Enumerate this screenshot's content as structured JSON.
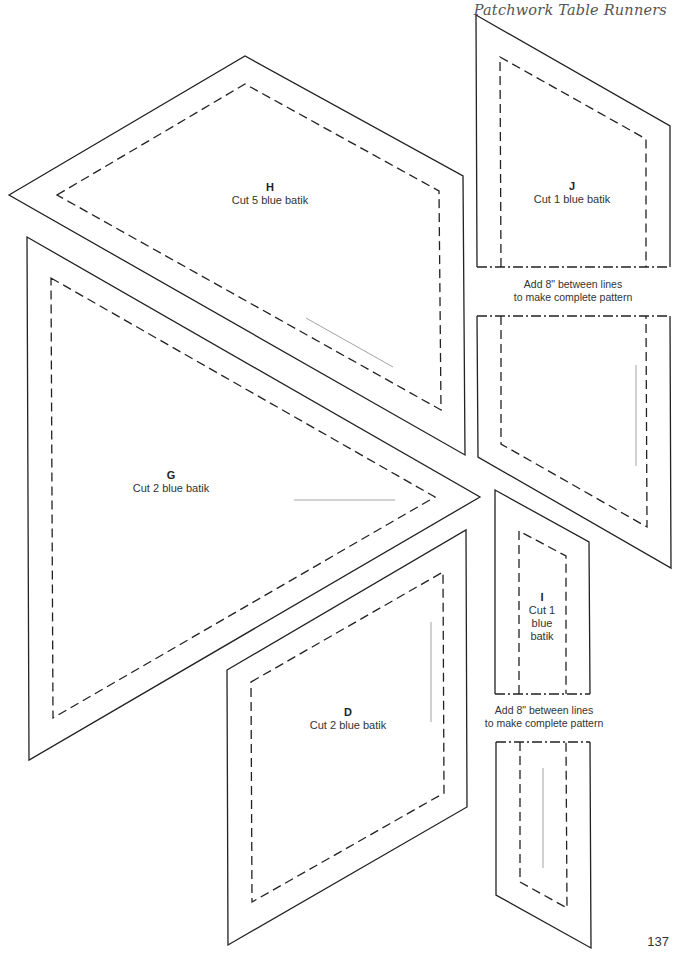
{
  "header": {
    "title": "Patchwork Table Runners"
  },
  "pieces": {
    "H": {
      "letter": "H",
      "instruction": "Cut 5 blue batik"
    },
    "J": {
      "letter": "J",
      "instruction": "Cut 1 blue batik"
    },
    "G": {
      "letter": "G",
      "instruction": "Cut 2 blue batik"
    },
    "I": {
      "letter": "I",
      "instruction_line1": "Cut 1",
      "instruction_line2": "blue",
      "instruction_line3": "batik"
    },
    "D": {
      "letter": "D",
      "instruction": "Cut 2 blue batik"
    }
  },
  "notes": {
    "j_extension_line1": "Add 8\" between lines",
    "j_extension_line2": "to make complete pattern",
    "i_extension_line1": "Add 8\" between lines",
    "i_extension_line2": "to make complete pattern"
  },
  "footer": {
    "page_number": "137"
  },
  "colors": {
    "outline": "#222222",
    "grainline": "#999999",
    "text": "#333333"
  }
}
